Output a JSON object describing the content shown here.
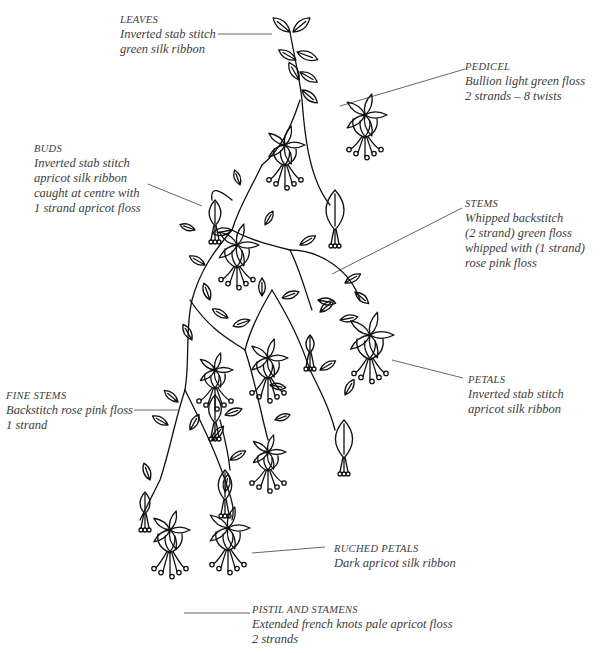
{
  "diagram": {
    "annotations": [
      {
        "id": "leaves",
        "title": "LEAVES",
        "lines": [
          "Inverted stab stitch",
          "green silk ribbon"
        ]
      },
      {
        "id": "pedicel",
        "title": "PEDICEL",
        "lines": [
          "Bullion light green floss",
          "2 strands – 8 twists"
        ]
      },
      {
        "id": "buds",
        "title": "BUDS",
        "lines": [
          "Inverted stab stitch",
          "apricot silk ribbon",
          "caught at centre with",
          "1 strand apricot floss"
        ]
      },
      {
        "id": "stems",
        "title": "STEMS",
        "lines": [
          "Whipped backstitch",
          "(2 strand) green floss",
          "whipped with (1 strand)",
          "rose pink floss"
        ]
      },
      {
        "id": "petals",
        "title": "PETALS",
        "lines": [
          "Inverted stab stitch",
          "apricot silk ribbon"
        ]
      },
      {
        "id": "fine-stems",
        "title": "FINE STEMS",
        "lines": [
          "Backstitch rose pink floss",
          "1 strand"
        ]
      },
      {
        "id": "ruched-petals",
        "title": "RUCHED PETALS",
        "lines": [
          "Dark apricot silk ribbon"
        ]
      },
      {
        "id": "pistil-stamens",
        "title": "PISTIL AND STAMENS",
        "lines": [
          "Extended french knots pale apricot floss",
          "2 strands"
        ]
      }
    ],
    "colors": {
      "ink": "#111111",
      "text": "#3d3d3d",
      "leader": "#555555"
    }
  }
}
